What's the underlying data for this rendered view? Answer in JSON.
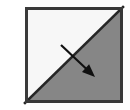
{
  "figure": {
    "title": "Diagonal split square with direction arrow",
    "canvas": {
      "width": 130,
      "height": 110,
      "background_color": "#ffffff"
    },
    "square": {
      "name": "split-square",
      "x": 25,
      "y": 7,
      "width": 98,
      "height": 96,
      "border_color": "#3a3a3a",
      "border_width": 3
    },
    "regions": [
      {
        "name": "upper-left-triangle",
        "label": "light region",
        "fill_color": "#f7f7f7",
        "points": "0,0 98,0 0,96"
      },
      {
        "name": "lower-right-triangle",
        "label": "gray region",
        "fill_color": "#868686",
        "points": "98,0 98,96 0,96"
      }
    ],
    "diagonal": {
      "name": "diagonal-divider",
      "color": "#262626",
      "width": 2.6,
      "x1": 0,
      "y1": 96,
      "x2": 98,
      "y2": 0
    },
    "arrow": {
      "name": "direction-arrow",
      "label": "normal direction",
      "color": "#101010",
      "shaft_width": 2.2,
      "tail_x": 36,
      "tail_y": 38,
      "tip_x": 70,
      "tip_y": 70,
      "head_length": 13,
      "head_half_width": 5.2
    }
  }
}
